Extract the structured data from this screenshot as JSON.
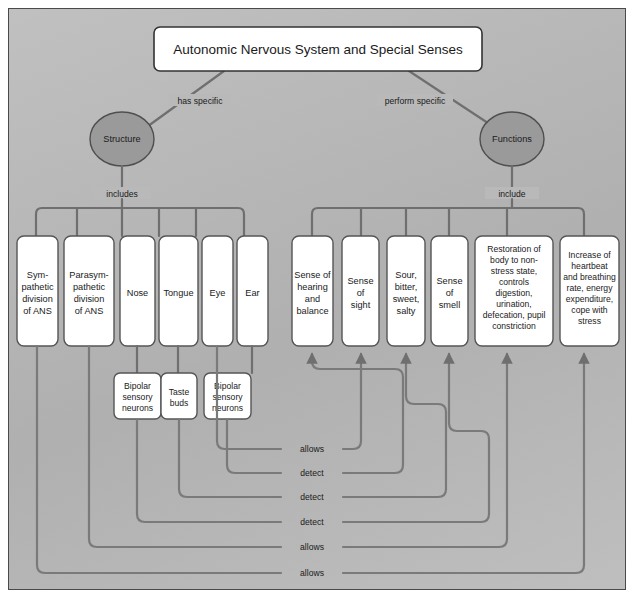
{
  "diagram": {
    "title": "Autonomic Nervous System and Special Senses",
    "type": "concept-map",
    "background_color": "#b9b9b9",
    "node_fill": "#ffffff",
    "ellipse_fill": "#9a9a9a",
    "connector_color": "#6f6f6f"
  },
  "root": {
    "label": "Autonomic Nervous System and Special Senses"
  },
  "branch_labels": {
    "left": "has specific",
    "right": "perform specific",
    "left_child": "includes",
    "right_child": "include"
  },
  "hubs": [
    {
      "id": "structure",
      "label": "Structure"
    },
    {
      "id": "functions",
      "label": "Functions"
    }
  ],
  "structure_nodes": [
    {
      "id": "sympathetic",
      "lines": [
        "Sym-",
        "pathetic",
        "division",
        "of ANS"
      ]
    },
    {
      "id": "parasympathetic",
      "lines": [
        "Parasym-",
        "pathetic",
        "division",
        "of ANS"
      ]
    },
    {
      "id": "nose",
      "lines": [
        "Nose"
      ]
    },
    {
      "id": "tongue",
      "lines": [
        "Tongue"
      ]
    },
    {
      "id": "eye",
      "lines": [
        "Eye"
      ]
    },
    {
      "id": "ear",
      "lines": [
        "Ear"
      ]
    }
  ],
  "function_nodes": [
    {
      "id": "hearing-balance",
      "lines": [
        "Sense of",
        "hearing",
        "and",
        "balance"
      ]
    },
    {
      "id": "sight",
      "lines": [
        "Sense",
        "of",
        "sight"
      ]
    },
    {
      "id": "taste",
      "lines": [
        "Sour,",
        "bitter,",
        "sweet,",
        "salty"
      ]
    },
    {
      "id": "smell",
      "lines": [
        "Sense",
        "of",
        "smell"
      ]
    },
    {
      "id": "parasympathetic-functions",
      "lines": [
        "Restoration of",
        "body to non-",
        "stress state,",
        "controls",
        "digestion,",
        "urination,",
        "defecation, pupil",
        "constriction"
      ]
    },
    {
      "id": "sympathetic-functions",
      "lines": [
        "Increase of",
        "heartbeat",
        "and breathing",
        "rate, energy",
        "expenditure,",
        "cope with",
        "stress"
      ]
    }
  ],
  "receptor_nodes": [
    {
      "id": "olfactory-neurons",
      "lines": [
        "Bipolar",
        "sensory",
        "neurons"
      ]
    },
    {
      "id": "taste-buds",
      "lines": [
        "Taste",
        "buds"
      ]
    },
    {
      "id": "auditory-neurons",
      "lines": [
        "Bipolar",
        "sensory",
        "neurons"
      ]
    }
  ],
  "cross_links": [
    {
      "id": "link-allows-1",
      "label": "allows",
      "from": "eye",
      "to": "sight"
    },
    {
      "id": "link-detect-1",
      "label": "detect",
      "from": "auditory-neurons",
      "to": "hearing-balance"
    },
    {
      "id": "link-detect-2",
      "label": "detect",
      "from": "taste-buds",
      "to": "taste"
    },
    {
      "id": "link-detect-3",
      "label": "detect",
      "from": "olfactory-neurons",
      "to": "smell"
    },
    {
      "id": "link-allows-2",
      "label": "allows",
      "from": "parasympathetic",
      "to": "parasympathetic-functions"
    },
    {
      "id": "link-allows-3",
      "label": "allows",
      "from": "sympathetic",
      "to": "sympathetic-functions"
    }
  ],
  "caption": ""
}
